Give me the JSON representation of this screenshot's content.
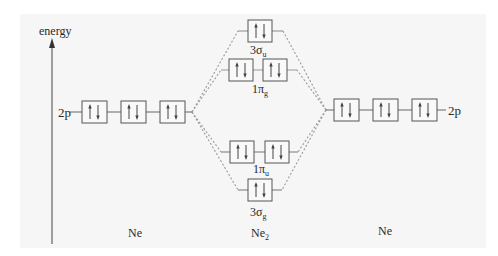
{
  "axis": {
    "label": "energy"
  },
  "atoms": {
    "left": {
      "name": "Ne",
      "orbital": "2p",
      "boxes": 3,
      "electrons_per_box": "↑↓"
    },
    "right": {
      "name": "Ne",
      "orbital": "2p",
      "boxes": 3,
      "electrons_per_box": "↑↓"
    }
  },
  "molecule": {
    "name": "Ne",
    "name_sub": "2",
    "orbitals": [
      {
        "id": "3su",
        "label": "3σ",
        "sub": "u",
        "boxes": 1,
        "electrons": "↑↓",
        "type": "antibonding"
      },
      {
        "id": "1pg",
        "label": "1π",
        "sub": "g",
        "boxes": 2,
        "electrons": "↑↓",
        "type": "antibonding"
      },
      {
        "id": "1pu",
        "label": "1π",
        "sub": "u",
        "boxes": 2,
        "electrons": "↑↓",
        "type": "bonding"
      },
      {
        "id": "3sg",
        "label": "3σ",
        "sub": "g",
        "boxes": 1,
        "electrons": "↑↓",
        "type": "bonding"
      }
    ]
  },
  "colors": {
    "line": "#555555",
    "dashed": "#999999",
    "box_fill": "#f9f9f9",
    "panel": "#f6f6f6"
  }
}
